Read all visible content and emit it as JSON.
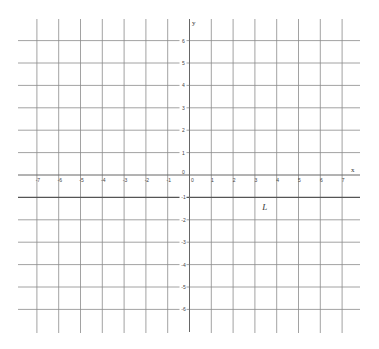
{
  "diagram": {
    "type": "coordinate-grid",
    "x_axis": {
      "label": "x",
      "min": -7,
      "max": 7,
      "tick_labels": [
        "-7",
        "-6",
        "-5",
        "-4",
        "-3",
        "-2",
        "-1",
        "0",
        "1",
        "2",
        "3",
        "4",
        "5",
        "6",
        "7"
      ]
    },
    "y_axis": {
      "label": "y",
      "min": -6,
      "max": 6,
      "tick_labels": [
        "6",
        "5",
        "4",
        "3",
        "2",
        "1",
        "0",
        "-1",
        "-2",
        "-3",
        "-4",
        "-5",
        "-6"
      ]
    },
    "annotations": [
      {
        "label": "L",
        "x": 3.5,
        "y": -1.5
      }
    ],
    "highlighted_line": {
      "y": -1
    },
    "colors": {
      "grid": "#8a8a8a",
      "axis": "#555555",
      "text": "#444444",
      "background": "#ffffff"
    }
  }
}
